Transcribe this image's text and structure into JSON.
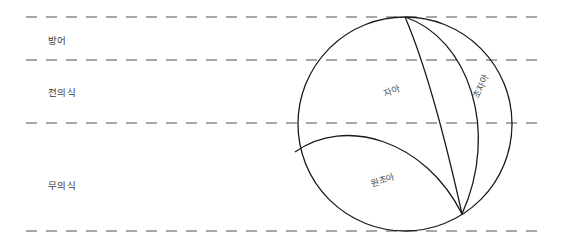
{
  "figure": {
    "title": "",
    "width": 570,
    "height": 247,
    "background_color": "#ffffff",
    "line_color": "#8a8a8a",
    "stroke_color": "#1a1a1a",
    "text_color": "#3a3a3a"
  },
  "consciousness_levels": [
    {
      "label": "방어",
      "x": 48,
      "y": 33,
      "boundary_top_y": 17,
      "boundary_bottom_y": 60
    },
    {
      "label": "전의식",
      "x": 48,
      "y": 85,
      "boundary_top_y": 60,
      "boundary_bottom_y": 123
    },
    {
      "label": "무의식",
      "x": 48,
      "y": 178,
      "boundary_top_y": 123,
      "boundary_bottom_y": 231
    }
  ],
  "dashed_lines": [
    {
      "y": 17,
      "x_start": 26,
      "x_end": 545
    },
    {
      "y": 60,
      "x_start": 26,
      "x_end": 545
    },
    {
      "y": 123,
      "x_start": 26,
      "x_end": 545
    },
    {
      "y": 231,
      "x_start": 26,
      "x_end": 545
    }
  ],
  "psyche_circle": {
    "cx": 405,
    "cy": 124,
    "r": 107,
    "top_point_x": 405,
    "top_point_y": 17,
    "convergence_point_x": 462,
    "convergence_point_y": 214
  },
  "regions": [
    {
      "name": "ego",
      "label": "자아",
      "x": 395,
      "y": 89,
      "rotation": -22
    },
    {
      "name": "superego",
      "label": "초자아",
      "x": 481,
      "y": 86,
      "rotation": -62
    },
    {
      "name": "id",
      "label": "원초아",
      "x": 388,
      "y": 178,
      "rotation": -18
    }
  ]
}
